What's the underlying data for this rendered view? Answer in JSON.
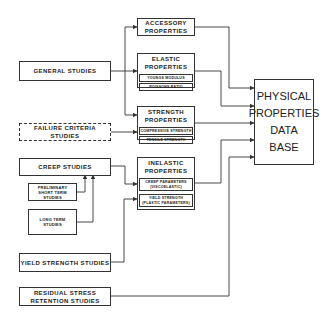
{
  "diagram": {
    "studies": {
      "general": "GENERAL STUDIES",
      "failure_criteria": [
        "FAILURE CRITERIA",
        "STUDIES"
      ],
      "creep": "CREEP STUDIES",
      "preliminary": [
        "PRELIMINARY",
        "SHORT TERM",
        "STUDIES"
      ],
      "long_term": [
        "LONG TERM",
        "STUDIES"
      ],
      "yield_strength": "YIELD STRENGTH STUDIES",
      "residual_stress": [
        "RESIDUAL STRESS",
        "RETENTION STUDIES"
      ]
    },
    "properties": {
      "accessory": [
        "ACCESSORY",
        "PROPERTIES"
      ],
      "elastic": {
        "title": [
          "ELASTIC",
          "PROPERTIES"
        ],
        "items": [
          "YOUNGS MODULUS",
          "POISSONS RATIO"
        ]
      },
      "strength": {
        "title": [
          "STRENGTH",
          "PROPERTIES"
        ],
        "items": [
          "COMPRESSIVE STRENGTH",
          "TENSILE STRENGTH"
        ]
      },
      "inelastic": {
        "title": [
          "INELASTIC",
          "PROPERTIES"
        ],
        "items": [
          [
            "CREEP PARAMETERS",
            "(VISCOELASTIC)"
          ],
          [
            "YIELD STRENGTH",
            "(PLASTIC PARAMETERS)"
          ]
        ]
      }
    },
    "database": [
      "PHYSICAL",
      "PROPERTIES",
      "DATA",
      "BASE"
    ],
    "colors": {
      "line": "#333333",
      "background": "#ffffff"
    }
  }
}
